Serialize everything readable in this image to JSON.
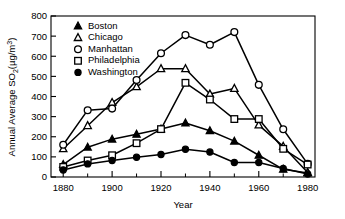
{
  "chart_data": {
    "type": "line",
    "title": "",
    "xlabel": "Year",
    "ylabel": "Annual Average SO2 (µg/m3)",
    "ylabel_parts": {
      "main": "Annual Average SO",
      "sub": "2",
      "unit_open": "(µg/m",
      "unit_sup": "3",
      "unit_close": ")"
    },
    "x": [
      1880,
      1890,
      1900,
      1910,
      1920,
      1930,
      1940,
      1950,
      1960,
      1970,
      1980
    ],
    "xlim": [
      1875,
      1983
    ],
    "ylim": [
      0,
      800
    ],
    "xticks": [
      1880,
      1900,
      1920,
      1940,
      1960,
      1980
    ],
    "xticks_minor": [
      1890,
      1910,
      1930,
      1950,
      1970
    ],
    "yticks": [
      0,
      100,
      200,
      300,
      400,
      500,
      600,
      700,
      800
    ],
    "grid": false,
    "legend_position": "upper-left-inside",
    "series": [
      {
        "name": "Boston",
        "marker": "filled-triangle",
        "values": [
          62,
          148,
          188,
          212,
          238,
          268,
          230,
          178,
          108,
          38,
          20
        ]
      },
      {
        "name": "Chicago",
        "marker": "open-triangle",
        "values": [
          140,
          255,
          370,
          448,
          538,
          538,
          412,
          440,
          258,
          152,
          22
        ]
      },
      {
        "name": "Manhattan",
        "marker": "open-circle",
        "values": [
          160,
          332,
          340,
          482,
          615,
          705,
          657,
          720,
          458,
          237,
          65
        ]
      },
      {
        "name": "Philadelphia",
        "marker": "open-square",
        "values": [
          50,
          82,
          108,
          168,
          238,
          468,
          385,
          288,
          288,
          140,
          62
        ]
      },
      {
        "name": "Washington",
        "marker": "filled-circle",
        "values": [
          35,
          65,
          82,
          98,
          112,
          138,
          124,
          72,
          72,
          42,
          15
        ]
      }
    ],
    "legend": [
      {
        "label": "Boston",
        "marker": "filled-triangle"
      },
      {
        "label": "Chicago",
        "marker": "open-triangle"
      },
      {
        "label": "Manhattan",
        "marker": "open-circle"
      },
      {
        "label": "Philadelphia",
        "marker": "open-square"
      },
      {
        "label": "Washington",
        "marker": "filled-circle"
      }
    ],
    "colors": {
      "axis": "#000000",
      "line": "#000000",
      "marker_fill_open": "#ffffff",
      "marker_fill_closed": "#000000",
      "background": "#ffffff"
    }
  }
}
